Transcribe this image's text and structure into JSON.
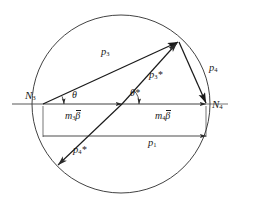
{
  "figure": {
    "background_color": "#ffffff",
    "stroke_color": "#1a1a1a",
    "thin_stroke_color": "#3a3a3a"
  },
  "points": {
    "n3": {
      "label": "N",
      "sub": "3"
    },
    "n4": {
      "label": "N",
      "sub": "4"
    }
  },
  "vectors": {
    "p3": {
      "label": "p",
      "sub": "3",
      "star": ""
    },
    "p4": {
      "label": "p",
      "sub": "4",
      "star": ""
    },
    "p3_star": {
      "label": "p",
      "sub": "3",
      "star": "*"
    },
    "p4_star": {
      "label": "p",
      "sub": "4",
      "star": "*"
    },
    "p1": {
      "label": "p",
      "sub": "1",
      "star": ""
    }
  },
  "angles": {
    "theta": {
      "label": "θ",
      "star": ""
    },
    "theta_star": {
      "label": "θ",
      "star": "*"
    }
  },
  "dimensions": {
    "m3beta": {
      "label": "m",
      "sub": "3",
      "symbol": "β"
    },
    "m4beta": {
      "label": "m",
      "sub": "4",
      "symbol": "β"
    }
  },
  "geometry": {
    "circle": {
      "cx": 121,
      "cy": 104,
      "r": 89
    },
    "n3_point": {
      "x": 43,
      "y": 104
    },
    "n4_point": {
      "x": 206,
      "y": 104
    },
    "apex_point": {
      "x": 178,
      "y": 42
    },
    "mid_point": {
      "x": 122,
      "y": 104
    },
    "p4star_tip": {
      "x": 57,
      "y": 166
    },
    "axis_left": {
      "x": 12,
      "y": 104
    },
    "axis_right": {
      "x": 228,
      "y": 104
    },
    "dim_line_y": 136
  }
}
